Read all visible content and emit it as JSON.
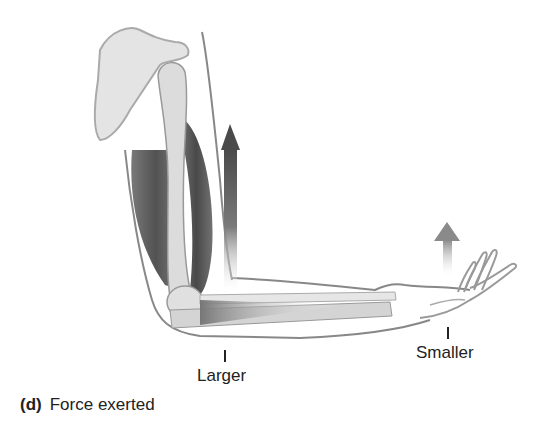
{
  "figure": {
    "arrows": [
      {
        "name": "biceps-force-arrow",
        "size": "large",
        "direction": "up"
      },
      {
        "name": "hand-force-arrow",
        "size": "small",
        "direction": "up"
      }
    ],
    "labels": {
      "larger": "Larger",
      "smaller": "Smaller"
    },
    "caption": {
      "letter": "(d)",
      "text": "Force exerted"
    },
    "colors": {
      "arrow_dark": "#4a4a4a",
      "muscle": "#5a5a5a",
      "bone": "#d8d8d8",
      "outline": "#888888"
    }
  }
}
